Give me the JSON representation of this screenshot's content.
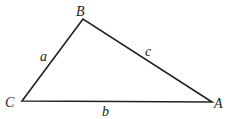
{
  "diagram": {
    "vertices": [
      {
        "name": "A",
        "label": "A",
        "x": 212,
        "y": 102,
        "lx": 214,
        "ly": 108
      },
      {
        "name": "B",
        "label": "B",
        "x": 83,
        "y": 19,
        "lx": 76,
        "ly": 16
      },
      {
        "name": "C",
        "label": "C",
        "x": 22,
        "y": 101,
        "lx": 5,
        "ly": 107
      }
    ],
    "sides": [
      {
        "name": "a",
        "label": "a",
        "from": "C",
        "to": "B",
        "lx": 40,
        "ly": 61
      },
      {
        "name": "b",
        "label": "b",
        "from": "C",
        "to": "A",
        "lx": 102,
        "ly": 116
      },
      {
        "name": "c",
        "label": "c",
        "from": "B",
        "to": "A",
        "lx": 145,
        "ly": 56
      }
    ],
    "stroke_color": "#222222"
  }
}
